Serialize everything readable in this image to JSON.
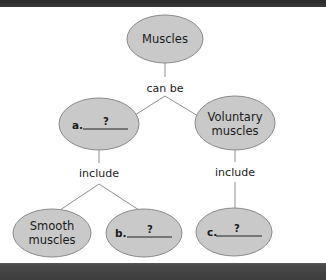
{
  "diagram": {
    "nodes": {
      "root": {
        "label": "Muscles"
      },
      "a": {
        "letter": "a.",
        "blank": "?"
      },
      "voluntary": {
        "line1": "Voluntary",
        "line2": "muscles"
      },
      "smooth": {
        "line1": "Smooth",
        "line2": "muscles"
      },
      "b": {
        "letter": "b.",
        "blank": "?"
      },
      "c": {
        "letter": "c.",
        "blank": "?"
      }
    },
    "links": {
      "root_to_types": "can be",
      "a_to_children": "include",
      "voluntary_to_children": "include"
    },
    "colors": {
      "node_fill": "#c9c9c9",
      "node_stroke": "#8a8a8a",
      "connector": "#8f8f8f",
      "frame_bar": "#3c3c3c"
    }
  }
}
